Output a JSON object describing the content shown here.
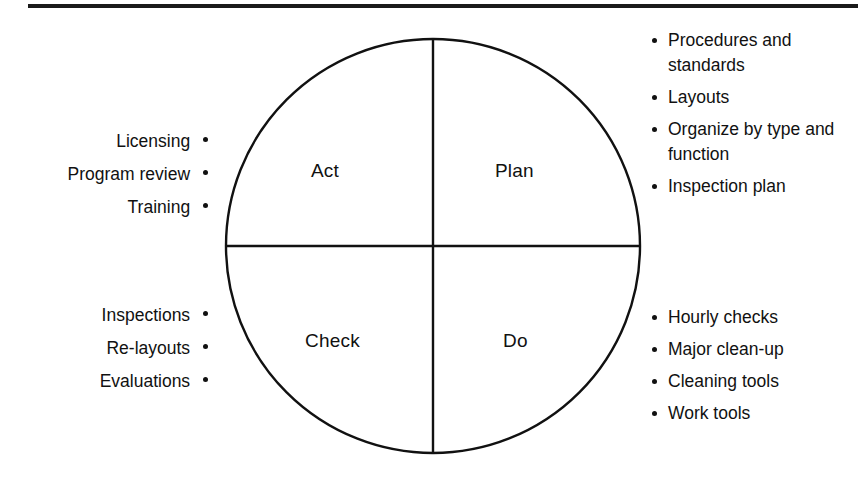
{
  "diagram": {
    "type": "pdca-cycle-wheel",
    "title_rule": "horizontal-divider",
    "accent_color": "#111111",
    "background_color": "#ffffff",
    "quadrants": [
      {
        "key": "act",
        "label": "Act",
        "position": "top-left"
      },
      {
        "key": "plan",
        "label": "Plan",
        "position": "top-right"
      },
      {
        "key": "check",
        "label": "Check",
        "position": "bottom-left"
      },
      {
        "key": "do",
        "label": "Do",
        "position": "bottom-right"
      }
    ],
    "lists": {
      "plan": {
        "side": "right",
        "items": [
          "Procedures and standards",
          "Layouts",
          "Organize by type and function",
          "Inspection plan"
        ]
      },
      "do": {
        "side": "right",
        "items": [
          "Hourly checks",
          "Major clean-up",
          "Cleaning tools",
          "Work tools"
        ]
      },
      "act": {
        "side": "left",
        "items": [
          "Licensing",
          "Program review",
          "Training"
        ]
      },
      "check": {
        "side": "left",
        "items": [
          "Inspections",
          "Re-layouts",
          "Evaluations"
        ]
      }
    }
  }
}
